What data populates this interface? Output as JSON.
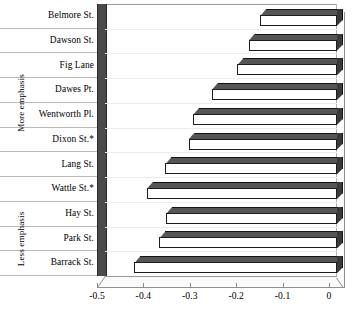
{
  "chart_data": {
    "type": "bar",
    "orientation": "horizontal",
    "title": "",
    "xlabel": "",
    "ylabel": "",
    "xlim": [
      -0.5,
      0
    ],
    "xticks": [
      -0.5,
      -0.4,
      -0.3,
      -0.2,
      -0.1,
      0
    ],
    "xtick_labels": [
      "-0.5",
      "-0.4",
      "-0.3",
      "-0.2",
      "-0.1",
      "0"
    ],
    "grid": false,
    "legend": null,
    "style": "3d-bar",
    "categories": [
      "Belmore St.",
      "Dawson St.",
      "Fig Lane",
      "Dawes Pt.",
      "Wentworth Pl.",
      "Dixon St.*",
      "Lang St.",
      "Wattle St.*",
      "Hay St.",
      "Park St.",
      "Barrack St."
    ],
    "values": [
      -0.165,
      -0.19,
      -0.215,
      -0.27,
      -0.31,
      -0.32,
      -0.37,
      -0.41,
      -0.368,
      -0.383,
      -0.437
    ],
    "groups": [
      {
        "label": "More emphasis",
        "from_index": 0,
        "to_index": 7
      },
      {
        "label": "Less emphasis",
        "from_index": 8,
        "to_index": 10
      }
    ]
  },
  "colors": {
    "bar_face": "#ffffff",
    "bar_outline": "#1c1c1c",
    "bar_shade_top": "#555555",
    "bar_shade_side": "#3a3a3a",
    "wall": "#4a4a4a",
    "axis": "#8a8a8a",
    "row_separator": "#b9b9b9",
    "background": "#ffffff"
  }
}
